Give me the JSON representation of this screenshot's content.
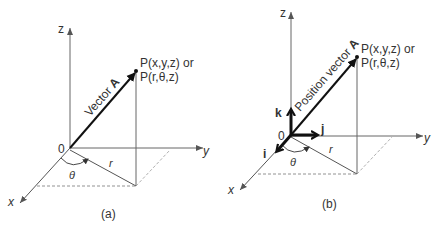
{
  "figure": {
    "panels": [
      {
        "id": "a",
        "caption": "(a)",
        "axes": {
          "x": "x",
          "y": "y",
          "z": "z",
          "origin": "0"
        },
        "vector_label_prefix": "Vector ",
        "vector_label_bold": "A",
        "point_line1": "P(x,y,z) or",
        "point_line2": "P(r,θ,z)",
        "r_label": "r",
        "theta_label": "θ"
      },
      {
        "id": "b",
        "caption": "(b)",
        "axes": {
          "x": "x",
          "y": "y",
          "z": "z",
          "origin": "0"
        },
        "vector_label_prefix": "Position vector ",
        "vector_label_bold": "A",
        "point_line1": "P(x,y,z) or",
        "point_line2": "P(r,θ,z)",
        "r_label": "r",
        "theta_label": "θ",
        "unit_vectors": {
          "i": "i",
          "j": "j",
          "k": "k"
        }
      }
    ]
  }
}
